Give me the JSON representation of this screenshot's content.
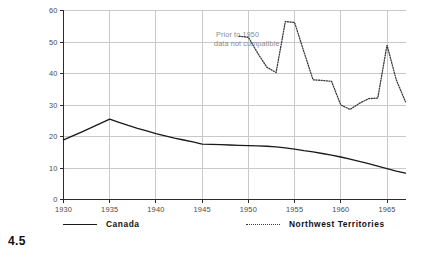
{
  "figure": {
    "number": "4.5"
  },
  "chart_data": {
    "type": "line",
    "title": "",
    "xlabel": "",
    "ylabel": "Average Value per Ton of Ore Mined\n(in 1957 Dollars )",
    "xlim": [
      1930,
      1967
    ],
    "ylim": [
      0,
      60
    ],
    "grid": true,
    "legend_position": "bottom",
    "xticks": [
      1930,
      1935,
      1940,
      1945,
      1950,
      1955,
      1960,
      1965
    ],
    "xticklabels": [
      "1930",
      "1935",
      "1940",
      "1945",
      "1950",
      "1955",
      "1960",
      "1965"
    ],
    "yticks": [
      0,
      10,
      20,
      30,
      40,
      50,
      60
    ],
    "yticklabels": [
      "0",
      "10",
      "20",
      "30",
      "40",
      "50",
      "60"
    ],
    "annotations": [
      {
        "text": "Prior to 1950\ndata not cumpatible",
        "line1": "Prior to 1950",
        "line2": "data not cumpatible",
        "x": 1946.5,
        "y": 52
      }
    ],
    "series": [
      {
        "name": "Canada",
        "style": "solid",
        "color": "#1a1a1a",
        "x": [
          1930,
          1931,
          1932,
          1933,
          1934,
          1935,
          1936,
          1937,
          1938,
          1939,
          1940,
          1941,
          1942,
          1943,
          1944,
          1945,
          1946,
          1947,
          1948,
          1949,
          1950,
          1951,
          1952,
          1953,
          1954,
          1955,
          1956,
          1957,
          1958,
          1959,
          1960,
          1961,
          1962,
          1963,
          1964,
          1965,
          1966,
          1967
        ],
        "values": [
          18.9,
          20.2,
          21.5,
          22.8,
          24.2,
          25.5,
          24.5,
          23.5,
          22.6,
          21.8,
          20.9,
          20.2,
          19.5,
          18.9,
          18.3,
          17.6,
          17.5,
          17.4,
          17.3,
          17.2,
          17.1,
          17.0,
          16.9,
          16.7,
          16.4,
          16.0,
          15.5,
          15.1,
          14.6,
          14.1,
          13.5,
          12.8,
          12.1,
          11.4,
          10.6,
          9.8,
          9.0,
          8.4
        ]
      },
      {
        "name": "Northwest Territories",
        "style": "dotted",
        "color": "#3a3a3a",
        "x": [
          1949,
          1950,
          1951,
          1952,
          1953,
          1954,
          1955,
          1956,
          1957,
          1958,
          1959,
          1960,
          1961,
          1962,
          1963,
          1964,
          1965,
          1966,
          1967
        ],
        "values": [
          51.8,
          51.5,
          46.5,
          42.0,
          40.3,
          56.5,
          56.2,
          47.0,
          38.0,
          37.8,
          37.5,
          30.0,
          28.6,
          30.5,
          32.0,
          32.2,
          49.0,
          38.0,
          31.0
        ]
      }
    ]
  },
  "legend": {
    "entries": [
      {
        "label": "Canada",
        "style": "solid"
      },
      {
        "label": "Northwest Territories",
        "style": "dotted"
      }
    ]
  }
}
